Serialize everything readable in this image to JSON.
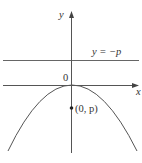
{
  "diagram": {
    "type": "parabola-directrix",
    "axes": {
      "x_label": "x",
      "y_label": "y",
      "origin_label": "0"
    },
    "directrix": {
      "label": "y = −p"
    },
    "focus": {
      "label": "(0, p)"
    },
    "curve": {
      "description": "downward-opening parabola with vertex at origin"
    },
    "colors": {
      "line": "#555555",
      "text": "#333333",
      "background": "#ffffff"
    }
  }
}
